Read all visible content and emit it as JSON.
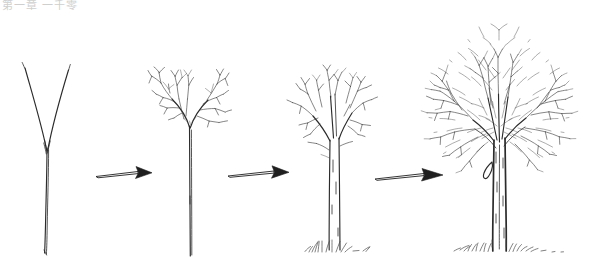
{
  "figure": {
    "background_color": "#ffffff",
    "ink_color": "#2b2b2b",
    "watermark_text": "第一章 一千零",
    "width": 597,
    "height": 276
  },
  "stages": [
    {
      "id": "stage-1",
      "label": "Y-shaped sapling with two bare leader branches",
      "order": "1",
      "center_x": 50,
      "ground_y": 255
    },
    {
      "id": "stage-2",
      "label": "Young sapling with branched twiggy crown on slender trunk",
      "order": "2",
      "center_x": 190,
      "ground_y": 258
    },
    {
      "id": "stage-3",
      "label": "Juvenile tree with thickened double-line trunk and spreading limbs",
      "order": "3",
      "center_x": 335,
      "ground_y": 252
    },
    {
      "id": "stage-4",
      "label": "Mature tree with dense rounded crown of fine twigs",
      "order": "4",
      "center_x": 500,
      "ground_y": 252
    }
  ],
  "arrows": [
    {
      "id": "arrow-1",
      "label": "growth arrow from stage 1 to stage 2",
      "x": 96,
      "y": 174,
      "length": 56
    },
    {
      "id": "arrow-2",
      "label": "growth arrow from stage 2 to stage 3",
      "x": 228,
      "y": 174,
      "length": 60
    },
    {
      "id": "arrow-3",
      "label": "growth arrow from stage 3 to stage 4",
      "x": 375,
      "y": 177,
      "length": 68
    }
  ]
}
